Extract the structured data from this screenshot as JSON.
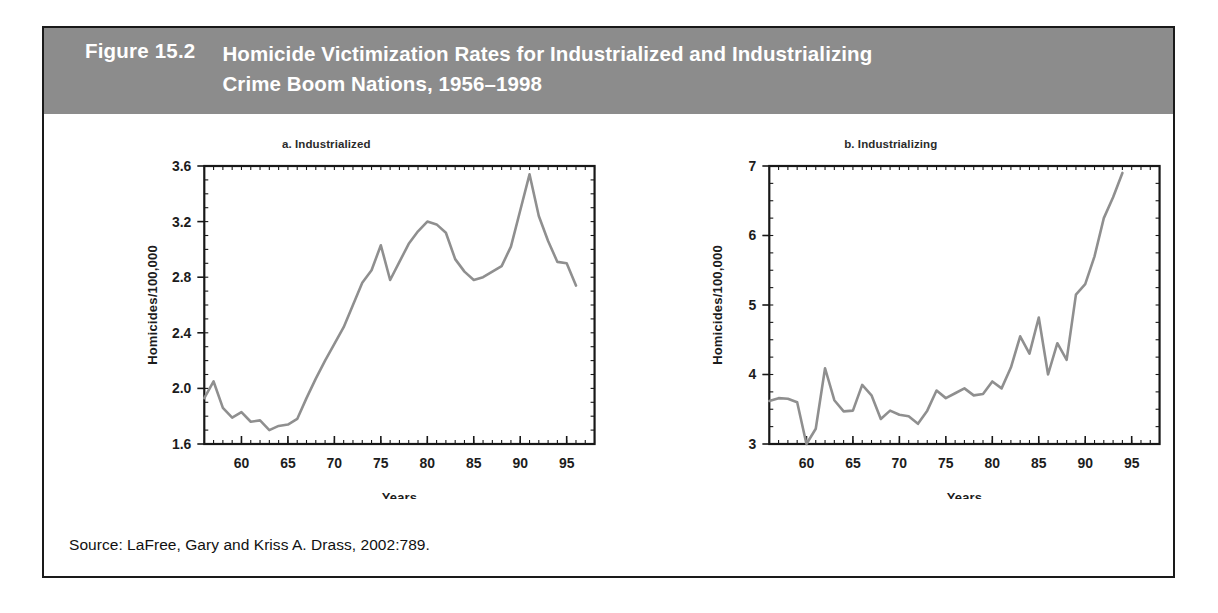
{
  "figure": {
    "number_label": "Figure 15.2",
    "title_line1": "Homicide Victimization Rates for Industrialized and Industrializing",
    "title_line2": "Crime Boom Nations, 1956–1998",
    "header_color": "#8c8c8c",
    "border_color": "#1a1a1a",
    "source": "Source: LaFree, Gary and Kriss A. Drass, 2002:789."
  },
  "chart_data": [
    {
      "type": "line",
      "title": "a. Industrialized",
      "xlabel": "Years",
      "ylabel": "Homicides/100,000",
      "xlim": [
        1956,
        1998
      ],
      "ylim": [
        1.6,
        3.6
      ],
      "yticks": [
        1.6,
        2.0,
        2.4,
        2.8,
        3.2,
        3.6
      ],
      "ytick_labels": [
        "1.6",
        "2.0",
        "2.4",
        "2.8",
        "3.2",
        "3.6"
      ],
      "xticks": [
        1960,
        1965,
        1970,
        1975,
        1980,
        1985,
        1990,
        1995
      ],
      "xtick_labels": [
        "60",
        "65",
        "70",
        "75",
        "80",
        "85",
        "90",
        "95"
      ],
      "grid": false,
      "legend": "none",
      "line_color": "#8f8f8f",
      "x": [
        1956,
        1957,
        1958,
        1959,
        1960,
        1961,
        1962,
        1963,
        1964,
        1965,
        1966,
        1967,
        1968,
        1969,
        1970,
        1971,
        1972,
        1973,
        1974,
        1975,
        1976,
        1977,
        1978,
        1979,
        1980,
        1981,
        1982,
        1983,
        1984,
        1985,
        1986,
        1987,
        1988,
        1989,
        1990,
        1991,
        1992,
        1993,
        1994,
        1995,
        1996
      ],
      "y": [
        1.93,
        2.05,
        1.86,
        1.79,
        1.83,
        1.76,
        1.77,
        1.7,
        1.73,
        1.74,
        1.78,
        1.93,
        2.07,
        2.2,
        2.32,
        2.44,
        2.6,
        2.76,
        2.85,
        3.03,
        2.78,
        2.91,
        3.04,
        3.13,
        3.2,
        3.18,
        3.12,
        2.93,
        2.84,
        2.78,
        2.8,
        2.84,
        2.88,
        3.02,
        3.28,
        3.54,
        3.24,
        3.06,
        2.91,
        2.9,
        2.74
      ],
      "series": [
        {
          "name": "Industrialized crime boom nations",
          "values": [
            1.93,
            2.05,
            1.86,
            1.79,
            1.83,
            1.76,
            1.77,
            1.7,
            1.73,
            1.74,
            1.78,
            1.93,
            2.07,
            2.2,
            2.32,
            2.44,
            2.6,
            2.76,
            2.85,
            3.03,
            2.78,
            2.91,
            3.04,
            3.13,
            3.2,
            3.18,
            3.12,
            2.93,
            2.84,
            2.78,
            2.8,
            2.84,
            2.88,
            3.02,
            3.28,
            3.54,
            3.24,
            3.06,
            2.91,
            2.9,
            2.74
          ]
        }
      ]
    },
    {
      "type": "line",
      "title": "b. Industrializing",
      "xlabel": "Years",
      "ylabel": "Homicides/100,000",
      "xlim": [
        1956,
        1998
      ],
      "ylim": [
        3,
        7
      ],
      "yticks": [
        3,
        4,
        5,
        6,
        7
      ],
      "ytick_labels": [
        "3",
        "4",
        "5",
        "6",
        "7"
      ],
      "xticks": [
        1960,
        1965,
        1970,
        1975,
        1980,
        1985,
        1990,
        1995
      ],
      "xtick_labels": [
        "60",
        "65",
        "70",
        "75",
        "80",
        "85",
        "90",
        "95"
      ],
      "grid": false,
      "legend": "none",
      "line_color": "#8f8f8f",
      "x": [
        1956,
        1957,
        1958,
        1959,
        1960,
        1961,
        1962,
        1963,
        1964,
        1965,
        1966,
        1967,
        1968,
        1969,
        1970,
        1971,
        1972,
        1973,
        1974,
        1975,
        1976,
        1977,
        1978,
        1979,
        1980,
        1981,
        1982,
        1983,
        1984,
        1985,
        1986,
        1987,
        1988,
        1989,
        1990,
        1991,
        1992,
        1993,
        1994
      ],
      "y": [
        3.62,
        3.66,
        3.65,
        3.6,
        3.0,
        3.22,
        4.09,
        3.63,
        3.47,
        3.48,
        3.85,
        3.7,
        3.36,
        3.48,
        3.42,
        3.4,
        3.29,
        3.48,
        3.77,
        3.66,
        3.73,
        3.8,
        3.7,
        3.72,
        3.9,
        3.8,
        4.1,
        4.55,
        4.3,
        4.82,
        4.0,
        4.45,
        4.21,
        5.15,
        5.3,
        5.7,
        6.25,
        6.55,
        6.9
      ],
      "series": [
        {
          "name": "Industrializing crime boom nations",
          "values": [
            3.62,
            3.66,
            3.65,
            3.6,
            3.0,
            3.22,
            4.09,
            3.63,
            3.47,
            3.48,
            3.85,
            3.7,
            3.36,
            3.48,
            3.42,
            3.4,
            3.29,
            3.48,
            3.77,
            3.66,
            3.73,
            3.8,
            3.7,
            3.72,
            3.9,
            3.8,
            4.1,
            4.55,
            4.3,
            4.82,
            4.0,
            4.45,
            4.21,
            5.15,
            5.3,
            5.7,
            6.25,
            6.55,
            6.9
          ]
        }
      ]
    }
  ]
}
